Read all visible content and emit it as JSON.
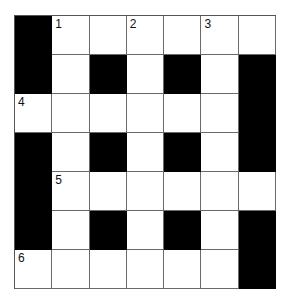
{
  "puzzle": {
    "rows": 7,
    "cols": 7,
    "grid": [
      [
        "#",
        "1",
        ".",
        "2",
        ".",
        "3",
        "."
      ],
      [
        "#",
        ".",
        "#",
        ".",
        "#",
        ".",
        "#"
      ],
      [
        "4",
        ".",
        ".",
        ".",
        ".",
        ".",
        "#"
      ],
      [
        "#",
        ".",
        "#",
        ".",
        "#",
        ".",
        "#"
      ],
      [
        "#",
        "5",
        ".",
        ".",
        ".",
        ".",
        "."
      ],
      [
        "#",
        ".",
        "#",
        ".",
        "#",
        ".",
        "#"
      ],
      [
        "6",
        ".",
        ".",
        ".",
        ".",
        ".",
        "#"
      ]
    ],
    "colors": {
      "black": "#000000",
      "white": "#ffffff",
      "line": "#6a6a6a"
    }
  }
}
